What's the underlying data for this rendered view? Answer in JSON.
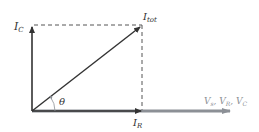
{
  "diagram": {
    "type": "phasor-diagram",
    "labels": {
      "ic_main": "I",
      "ic_sub": "C",
      "itot_main": "I",
      "itot_sub": "tot",
      "ir_main": "I",
      "ir_sub": "R",
      "theta": "θ",
      "axis_label": "V",
      "axis_sub_s": "s",
      "axis_mid1": ", V",
      "axis_sub_r": "R",
      "axis_mid2": ", V",
      "axis_sub_c": "C"
    },
    "colors": {
      "vector": "#333333",
      "dashed": "#555555",
      "axis": "#8c9096"
    }
  }
}
